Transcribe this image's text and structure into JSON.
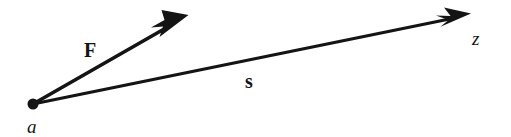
{
  "figure": {
    "kind": "vector-diagram",
    "width": 511,
    "height": 137,
    "background_color": "#ffffff",
    "ink_color": "#141414"
  },
  "origin": {
    "name": "a",
    "label": "a",
    "x": 33,
    "y": 104,
    "dot_radius": 5.5
  },
  "vectors": [
    {
      "id": "F",
      "label": "F",
      "style": "bold-upright-serif",
      "from": {
        "x": 33,
        "y": 104
      },
      "to": {
        "x": 188,
        "y": 16
      },
      "shaft_width": 3.6,
      "arrowhead": "swept-barb",
      "label_position": {
        "x": 84,
        "y": 40
      }
    },
    {
      "id": "s",
      "label": "s",
      "style": "bold-upright-serif",
      "from": {
        "x": 33,
        "y": 104
      },
      "to": {
        "x": 471,
        "y": 14
      },
      "shaft_width": 3.2,
      "arrowhead": "swept-barb",
      "label_position": {
        "x": 245,
        "y": 71
      }
    }
  ],
  "points": [
    {
      "id": "a",
      "label": "a",
      "style": "italic-serif",
      "x": 27,
      "y": 117
    },
    {
      "id": "z",
      "label": "z",
      "style": "italic-serif",
      "x": 472,
      "y": 29
    }
  ]
}
